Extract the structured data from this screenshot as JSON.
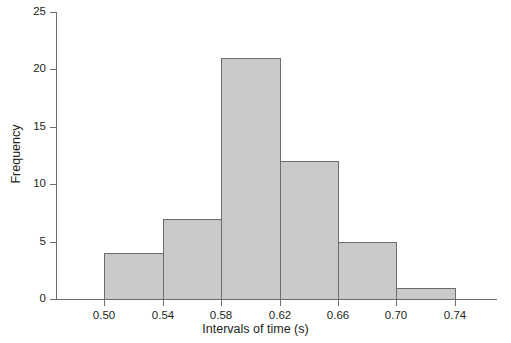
{
  "chart_data": {
    "type": "bar",
    "title": "",
    "subtitle": "",
    "xlabel": "Intervals of time (s)",
    "ylabel": "Frequency",
    "categories": [
      "0.50–0.54",
      "0.54–0.58",
      "0.58–0.62",
      "0.62–0.66",
      "0.66–0.70",
      "0.70–0.74"
    ],
    "bin_edges": [
      0.5,
      0.54,
      0.58,
      0.62,
      0.66,
      0.7,
      0.74
    ],
    "bin_width": 0.04,
    "values": [
      4,
      7,
      21,
      12,
      5,
      1
    ],
    "series": [
      {
        "name": "Frequency",
        "values": [
          4,
          7,
          21,
          12,
          5,
          1
        ]
      }
    ],
    "xlim": [
      0.48,
      0.77
    ],
    "ylim": [
      0,
      25
    ],
    "xticks": [
      0.5,
      0.54,
      0.58,
      0.62,
      0.66,
      0.7,
      0.74
    ],
    "xtick_labels": [
      "0.50",
      "0.54",
      "0.58",
      "0.62",
      "0.66",
      "0.70",
      "0.74"
    ],
    "yticks": [
      0,
      5,
      10,
      15,
      20,
      25
    ],
    "ytick_labels": [
      "0",
      "5",
      "10",
      "15",
      "20",
      "25"
    ],
    "grid": false,
    "legend": false,
    "legend_position": "none",
    "bar_fill_color": "#c9c9c9",
    "bar_border_color": "#6d6d6d",
    "axis_color": "#6e6e6e",
    "text_color": "#231f20",
    "background_color": "#ffffff"
  }
}
